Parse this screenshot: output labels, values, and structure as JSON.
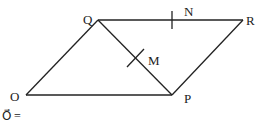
{
  "diagram": {
    "type": "parallelogram-geometry",
    "stroke_color": "#222222",
    "vertices": {
      "O": {
        "label": "O",
        "x": 26,
        "y": 95
      },
      "P": {
        "label": "P",
        "x": 172,
        "y": 95
      },
      "Q": {
        "label": "Q",
        "x": 98,
        "y": 20
      },
      "R": {
        "label": "R",
        "x": 243,
        "y": 20
      }
    },
    "segments": [
      "OP",
      "PR",
      "RQ",
      "QO",
      "QP"
    ],
    "points": {
      "M": {
        "label": "M",
        "on": "QP",
        "x": 135,
        "y": 58
      },
      "N": {
        "label": "N",
        "on": "QR",
        "x": 172,
        "y": 20
      }
    },
    "footer_text": "O⃗ ="
  }
}
